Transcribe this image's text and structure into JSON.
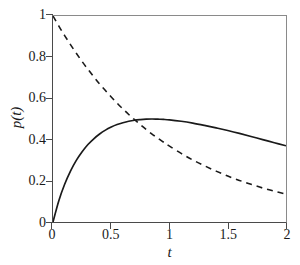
{
  "chart_data": {
    "type": "line",
    "title": "",
    "xlabel": "t",
    "ylabel": "p(t)",
    "xlim": [
      0,
      2
    ],
    "ylim": [
      0,
      1
    ],
    "grid": false,
    "legend": "none",
    "xticks": [
      "0",
      "0.5",
      "1",
      "1.5",
      "2"
    ],
    "xtick_values": [
      0,
      0.5,
      1,
      1.5,
      2
    ],
    "yticks": [
      "0",
      "0.2",
      "0.4",
      "0.6",
      "0.8",
      "1"
    ],
    "ytick_values": [
      0,
      0.2,
      0.4,
      0.6,
      0.8,
      1
    ],
    "x": [
      0,
      0.05,
      0.1,
      0.15,
      0.2,
      0.25,
      0.3,
      0.35,
      0.4,
      0.45,
      0.5,
      0.55,
      0.6,
      0.65,
      0.7,
      0.75,
      0.8,
      0.85,
      0.9,
      0.95,
      1,
      1.1,
      1.2,
      1.3,
      1.4,
      1.5,
      1.6,
      1.7,
      1.8,
      1.9,
      2
    ],
    "series": [
      {
        "name": "solid-curve",
        "style": "solid",
        "color": "#1a1a1a",
        "width": 1.7,
        "values": [
          0,
          0.103,
          0.183,
          0.247,
          0.299,
          0.341,
          0.376,
          0.404,
          0.427,
          0.446,
          0.461,
          0.473,
          0.482,
          0.489,
          0.494,
          0.497,
          0.499,
          0.5,
          0.499,
          0.498,
          0.496,
          0.489,
          0.48,
          0.469,
          0.457,
          0.444,
          0.43,
          0.415,
          0.4,
          0.385,
          0.37
        ]
      },
      {
        "name": "dashed-curve",
        "style": "dashed",
        "color": "#1a1a1a",
        "width": 1.6,
        "values": [
          1,
          0.951,
          0.905,
          0.861,
          0.819,
          0.779,
          0.741,
          0.705,
          0.67,
          0.638,
          0.607,
          0.577,
          0.549,
          0.522,
          0.497,
          0.472,
          0.449,
          0.427,
          0.407,
          0.387,
          0.368,
          0.333,
          0.301,
          0.273,
          0.247,
          0.223,
          0.202,
          0.183,
          0.165,
          0.15,
          0.135
        ]
      }
    ],
    "annotations": {
      "crossing_point": {
        "t": 0.72,
        "p": 0.49
      },
      "peak_point": {
        "t": 0.85,
        "p": 0.5
      }
    }
  }
}
